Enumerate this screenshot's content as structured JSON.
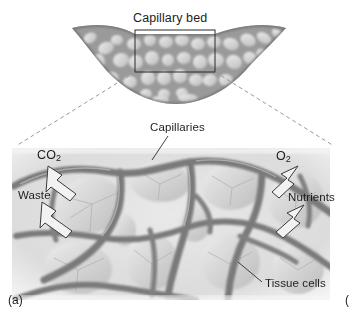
{
  "figure": {
    "panel_marker": "(a)",
    "next_panel_marker_partial": "(",
    "overview": {
      "title": "Capillary bed",
      "shape": "crescent-shaped capillary network",
      "selection_box": {
        "x": 135,
        "y": 30,
        "width": 80,
        "height": 42
      }
    },
    "detail": {
      "labels": {
        "capillaries": "Capillaries",
        "tissue_cells": "Tissue cells"
      },
      "exchange": {
        "outbound": [
          {
            "name": "carbon-dioxide",
            "text": "CO",
            "subscript": "2",
            "direction": "out"
          },
          {
            "name": "waste",
            "text": "Waste",
            "subscript": "",
            "direction": "out"
          }
        ],
        "inbound": [
          {
            "name": "oxygen",
            "text": "O",
            "subscript": "2",
            "direction": "in"
          },
          {
            "name": "nutrients",
            "text": "Nutrients",
            "subscript": "",
            "direction": "in"
          }
        ]
      }
    },
    "colors": {
      "text": "#1d1d1d",
      "vessel_dark": "#6f6f6f",
      "vessel_mid": "#8d8d8d",
      "tissue_light": "#d8d8d8",
      "background": "#ffffff",
      "dashed_line": "#9a9a9a",
      "box_stroke": "#2a2a2a",
      "arrow_fill": "#f2f2f2",
      "arrow_stroke": "#3a3a3a"
    }
  }
}
